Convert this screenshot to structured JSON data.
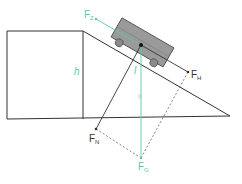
{
  "diagram": {
    "colors": {
      "lines": "#333333",
      "accent": "#5cc6b0",
      "cart_body": "#9a9a9a",
      "cart_wheels": "#8a8a8a",
      "dashed": "#666666"
    },
    "labels": {
      "height": "h",
      "length": "l",
      "parallel_mark": "//",
      "F_Z": {
        "main": "F",
        "sub": "Z"
      },
      "F_H": {
        "main": "F",
        "sub": "H"
      },
      "F_N": {
        "main": "F",
        "sub": "N"
      },
      "F_G": {
        "main": "F",
        "sub": "G"
      }
    }
  }
}
